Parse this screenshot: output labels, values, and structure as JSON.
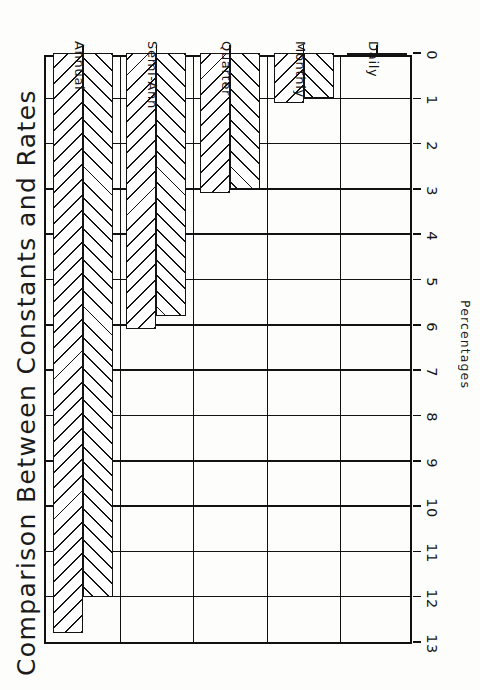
{
  "chart_data": {
    "type": "bar",
    "orientation": "horizontal",
    "title": "Comparison Between Constants and Rates",
    "subtitle": "By Payment Period",
    "xlabel": "Percentages",
    "ylabel": "",
    "categories": [
      "Annual",
      "Semi-Ann",
      "Quarter",
      "Monthly",
      "Daily"
    ],
    "series": [
      {
        "name": "Mortgage Constants",
        "values": [
          12.8,
          6.1,
          3.1,
          1.1,
          0.05
        ],
        "hatch": "diagonal-up"
      },
      {
        "name": "Interest Rates",
        "values": [
          12.0,
          5.8,
          3.0,
          1.0,
          0.04
        ],
        "hatch": "diagonal-down"
      }
    ],
    "tick_labels": [
      "13",
      "12",
      "11",
      "10",
      "9",
      "8",
      "7",
      "6",
      "5",
      "4",
      "3",
      "2",
      "1",
      "0"
    ],
    "xlim": [
      0,
      13
    ],
    "axis_direction": "descending-left-to-right",
    "grid": true,
    "legend_position": "bottom"
  },
  "legend": {
    "entries": [
      {
        "label": "Mortgage Constants"
      },
      {
        "label": "Interest Rates"
      }
    ]
  },
  "colors": {
    "ink": "#111111",
    "paper": "#fdfdfb"
  }
}
